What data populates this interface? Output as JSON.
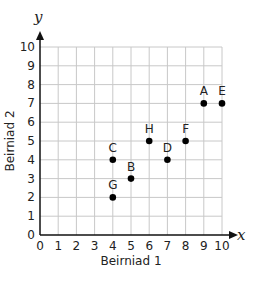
{
  "chart_data": {
    "type": "scatter",
    "title": "",
    "xlabel": "Beirniad 1",
    "ylabel": "Beirniad 2",
    "x_axis_var": "x",
    "y_axis_var": "y",
    "xlim": [
      0,
      10
    ],
    "ylim": [
      0,
      10
    ],
    "x_ticks": [
      "0",
      "1",
      "2",
      "3",
      "4",
      "5",
      "6",
      "7",
      "8",
      "9",
      "10"
    ],
    "y_ticks": [
      "0",
      "1",
      "2",
      "3",
      "4",
      "5",
      "6",
      "7",
      "8",
      "9",
      "10"
    ],
    "grid": true,
    "legend": null,
    "points": [
      {
        "label": "A",
        "x": 9,
        "y": 7
      },
      {
        "label": "B",
        "x": 5,
        "y": 3
      },
      {
        "label": "C",
        "x": 4,
        "y": 4
      },
      {
        "label": "D",
        "x": 7,
        "y": 4
      },
      {
        "label": "E",
        "x": 10,
        "y": 7
      },
      {
        "label": "F",
        "x": 8,
        "y": 5
      },
      {
        "label": "G",
        "x": 4,
        "y": 2
      },
      {
        "label": "H",
        "x": 6,
        "y": 5
      }
    ],
    "colors": {
      "grid": "#c8c8c8",
      "axis": "#111111",
      "points": "#000000"
    }
  }
}
